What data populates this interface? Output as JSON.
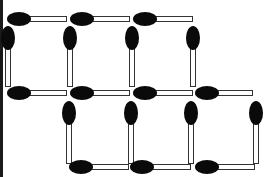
{
  "figure": {
    "type": "matchstick-puzzle",
    "head_color": "#0a0a0a",
    "stick_color": "#ffffff",
    "stick_outline": "#333333",
    "match_count": 21,
    "squares": 7
  },
  "matches": {
    "top_row_horizontal": [
      {
        "x": 7,
        "y": 12,
        "length": 60
      },
      {
        "x": 70,
        "y": 12,
        "length": 60
      },
      {
        "x": 133,
        "y": 12,
        "length": 60
      }
    ],
    "upper_vertical": [
      {
        "x": 1,
        "y": 26,
        "length": 61
      },
      {
        "x": 63,
        "y": 26,
        "length": 61
      },
      {
        "x": 125,
        "y": 26,
        "length": 61
      },
      {
        "x": 186,
        "y": 26,
        "length": 61
      }
    ],
    "middle_row_horizontal": [
      {
        "x": 7,
        "y": 86,
        "length": 60
      },
      {
        "x": 70,
        "y": 86,
        "length": 60
      },
      {
        "x": 133,
        "y": 86,
        "length": 60
      },
      {
        "x": 195,
        "y": 86,
        "length": 58
      }
    ],
    "lower_vertical": [
      {
        "x": 62,
        "y": 101,
        "length": 63
      },
      {
        "x": 124,
        "y": 101,
        "length": 63
      },
      {
        "x": 184,
        "y": 101,
        "length": 63
      },
      {
        "x": 249,
        "y": 101,
        "length": 63
      }
    ],
    "bottom_row_horizontal": [
      {
        "x": 69,
        "y": 160,
        "length": 60
      },
      {
        "x": 130,
        "y": 160,
        "length": 61
      },
      {
        "x": 195,
        "y": 160,
        "length": 60
      }
    ]
  }
}
